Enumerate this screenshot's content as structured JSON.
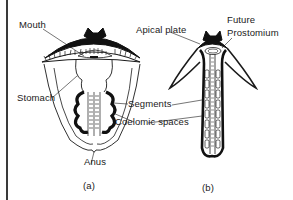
{
  "figure_a": {
    "labels": {
      "mouth": "Mouth",
      "stomach": "Stomach",
      "anus": "Anus"
    },
    "caption": "(a)"
  },
  "figure_b": {
    "labels": {
      "apical_plate": "Apical plate",
      "future_prostomium_line1": "Future",
      "future_prostomium_line2": "Prostomium"
    },
    "caption": "(b)"
  },
  "shared_labels": {
    "segments": "Segments",
    "coelomic_spaces": "Coelomic spaces"
  },
  "colors": {
    "ink": "#1a1a1a",
    "background": "#ffffff"
  }
}
